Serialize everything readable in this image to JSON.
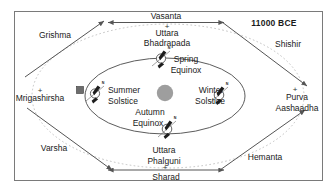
{
  "figure": {
    "era_label": "11000 BCE",
    "frame": {
      "border_color": "#7a7a7a",
      "background": "#ffffff"
    }
  },
  "colors": {
    "sun": "#9e9e9e",
    "orbit_inner": "#4a4a4a",
    "orbit_outer_dashed": "#b9b9b9",
    "arrow": "#555555",
    "axis_line": "#6f6f6f",
    "earth_outline": "#3a3a3a",
    "tilt_marker": "#1d1d1d",
    "text": "#1a1a1a"
  },
  "seasons": [
    {
      "name": "Vasanta",
      "position": "top",
      "kind": "axis-arrow"
    },
    {
      "name": "Grishma",
      "position": "top-left",
      "kind": "diagonal-arrow"
    },
    {
      "name": "Shishir",
      "position": "top-right",
      "kind": "diagonal-arrow"
    },
    {
      "name": "Varsha",
      "position": "bottom-left",
      "kind": "diagonal-arrow"
    },
    {
      "name": "Hemanta",
      "position": "bottom-right",
      "kind": "diagonal-arrow"
    },
    {
      "name": "Sharad",
      "position": "bottom",
      "kind": "axis-arrow"
    }
  ],
  "nakshatras": [
    {
      "name": "Uttara Bhadrapada",
      "line1": "Uttara",
      "line2": "Bhadrapada",
      "position": "top"
    },
    {
      "name": "Mrigashirsha",
      "line1": "Mrigashirsha",
      "line2": "",
      "position": "left"
    },
    {
      "name": "Purva Aashaadha",
      "line1": "Purva",
      "line2": "Aashaadha",
      "position": "right"
    },
    {
      "name": "Uttara Phalguni",
      "line1": "Uttara",
      "line2": "Phalguni",
      "position": "bottom"
    }
  ],
  "orbit_points": [
    {
      "name": "Spring Equinox",
      "line1": "Spring",
      "line2": "Equinox",
      "position": "top",
      "marker": "earth-tilt"
    },
    {
      "name": "Summer Solstice",
      "line1": "Summer",
      "line2": "Solstice",
      "position": "left",
      "marker": "earth-tilt"
    },
    {
      "name": "Winter Solstice",
      "line1": "Winter",
      "line2": "Solstice",
      "position": "right",
      "marker": "earth-tilt"
    },
    {
      "name": "Autumn Equinox",
      "line1": "Autumn",
      "line2": "Equinox",
      "position": "bottom",
      "marker": "earth-tilt"
    }
  ],
  "earth_markers": [
    {
      "at": "spring-equinox",
      "pole_label": "N"
    },
    {
      "at": "summer-solstice",
      "pole_label": "N"
    },
    {
      "at": "winter-solstice",
      "pole_label": "N"
    },
    {
      "at": "autumn-equinox",
      "pole_label": "N"
    }
  ],
  "center_body": {
    "name": "Sun",
    "shape": "disc"
  },
  "crosshair_marks": [
    {
      "name": "top-cross",
      "glyph": "+"
    },
    {
      "name": "left-cross",
      "glyph": "+"
    },
    {
      "name": "right-cross",
      "glyph": "+"
    },
    {
      "name": "bottom-cross",
      "glyph": "+"
    }
  ]
}
